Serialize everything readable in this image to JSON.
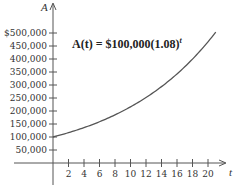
{
  "chart_data": {
    "type": "line",
    "title": "",
    "annotation": "A(t) = $100,000(1.08)^t",
    "formula": {
      "prefix": "A(t) = $100,000(1.08)",
      "exponent": "t"
    },
    "xlabel": "t",
    "ylabel": "A",
    "xlim": [
      0,
      22
    ],
    "ylim": [
      0,
      520000
    ],
    "xticks": [
      2,
      4,
      6,
      8,
      10,
      12,
      14,
      16,
      18,
      20
    ],
    "yticks": [
      50000,
      100000,
      150000,
      200000,
      250000,
      300000,
      350000,
      400000,
      450000,
      500000
    ],
    "ytick_labels": [
      "50,000",
      "100,000",
      "150,000",
      "200,000",
      "250,000",
      "300,000",
      "350,000",
      "400,000",
      "450,000",
      "$500,000"
    ],
    "xtick_labels": [
      "2",
      "4",
      "6",
      "8",
      "10",
      "12",
      "14",
      "16",
      "18",
      "20"
    ],
    "grid": false,
    "series": [
      {
        "name": "A(t)",
        "x": [
          0,
          2,
          4,
          6,
          8,
          10,
          12,
          14,
          16,
          18,
          20,
          21
        ],
        "values": [
          100000,
          116640,
          136049,
          158687,
          185093,
          215892,
          251817,
          293719,
          342594,
          399602,
          466096,
          503383
        ]
      }
    ]
  }
}
